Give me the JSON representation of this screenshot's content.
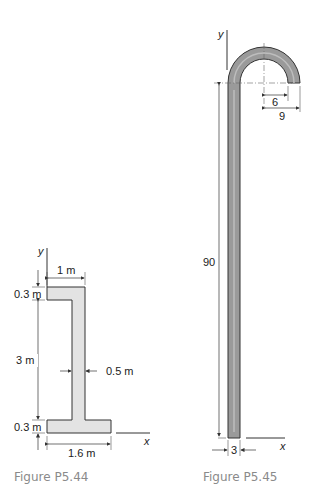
{
  "figures": [
    {
      "caption": "Figure P5.44",
      "axes": {
        "x": "x",
        "y": "y"
      },
      "dimensions": {
        "top_flange_width": "1 m",
        "top_flange_thickness": "0.3 m",
        "web_height": "3 m",
        "web_thickness": "0.5 m",
        "bottom_flange_thickness": "0.3 m",
        "bottom_flange_width": "1.6 m"
      },
      "colors": {
        "fill": "#e3e3e3",
        "stroke": "#333333"
      }
    },
    {
      "caption": "Figure P5.45",
      "axes": {
        "x": "x",
        "y": "y"
      },
      "dimensions": {
        "height": "90",
        "thickness": "3",
        "inner_radius": "6",
        "outer_radius": "9"
      },
      "colors": {
        "fill": "#9a9a9a",
        "stroke": "#333333"
      }
    }
  ]
}
